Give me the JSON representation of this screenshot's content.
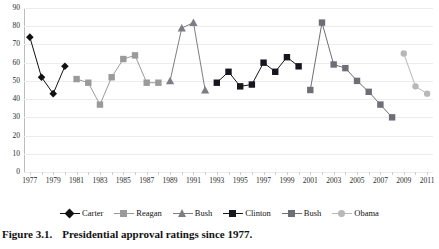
{
  "caption": {
    "number": "Figure 3.1.",
    "text": "Presidential approval ratings since 1977."
  },
  "chart_data": {
    "type": "line",
    "title": "",
    "subtitle": "",
    "xlabel": "",
    "ylabel": "",
    "xlim": [
      1976.5,
      2011.5
    ],
    "ylim": [
      0,
      90
    ],
    "ytick_step": 10,
    "grid": true,
    "legend_position": "bottom",
    "yticks": [
      0,
      10,
      20,
      30,
      40,
      50,
      60,
      70,
      80,
      90
    ],
    "xticks": [
      1977,
      1979,
      1981,
      1983,
      1985,
      1987,
      1989,
      1991,
      1993,
      1995,
      1997,
      1999,
      2001,
      2003,
      2005,
      2007,
      2009,
      2011
    ],
    "xticklabels": [
      "1977",
      "1979",
      "1981",
      "1983",
      "1985",
      "1987",
      "1989",
      "1991",
      "1993",
      "1995",
      "1997",
      "1999",
      "2001",
      "2003",
      "2005",
      "2007",
      "2009",
      "2011"
    ],
    "series": [
      {
        "name": "Carter",
        "marker": "diamond",
        "color": "#111111",
        "x": [
          1977,
          1978,
          1979,
          1980
        ],
        "values": [
          74,
          52,
          43,
          58
        ]
      },
      {
        "name": "Reagan",
        "marker": "square",
        "color": "#9a9a9a",
        "x": [
          1981,
          1982,
          1983,
          1984,
          1985,
          1986,
          1987,
          1988
        ],
        "values": [
          51,
          49,
          37,
          52,
          62,
          64,
          49,
          49
        ]
      },
      {
        "name": "Bush",
        "marker": "triangle",
        "color": "#7d7d85",
        "x": [
          1989,
          1990,
          1991,
          1992
        ],
        "values": [
          50,
          79,
          82,
          45
        ]
      },
      {
        "name": "Clinton",
        "marker": "square",
        "color": "#16161e",
        "x": [
          1993,
          1994,
          1995,
          1996,
          1997,
          1998,
          1999,
          2000
        ],
        "values": [
          49,
          55,
          47,
          48,
          60,
          55,
          63,
          58
        ]
      },
      {
        "name": "Bush",
        "marker": "square",
        "color": "#6e6e76",
        "x": [
          2001,
          2002,
          2003,
          2004,
          2005,
          2006,
          2007,
          2008
        ],
        "values": [
          45,
          82,
          59,
          57,
          50,
          44,
          37,
          30
        ]
      },
      {
        "name": "Obama",
        "marker": "circle",
        "color": "#b8b8b8",
        "x": [
          2009,
          2010,
          2011
        ],
        "values": [
          65,
          47,
          43
        ]
      }
    ]
  }
}
